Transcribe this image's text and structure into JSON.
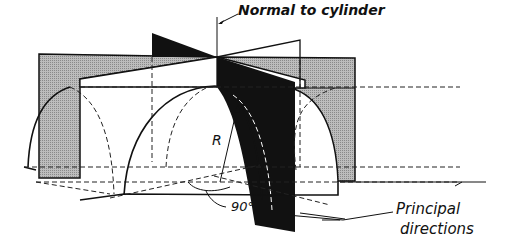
{
  "diagram": {
    "labels": {
      "normal": "Normal to cylinder",
      "radius": "R",
      "angle": "90°",
      "principal_line1": "Principal",
      "principal_line2": "directions"
    },
    "colors": {
      "background": "#ffffff",
      "line": "#111111",
      "gray_plane": "#a8a8a8",
      "black_plane": "#111111"
    }
  }
}
